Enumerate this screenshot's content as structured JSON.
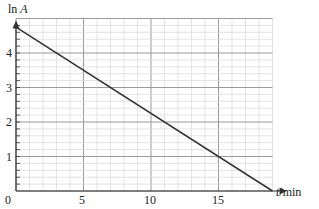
{
  "chart_data": {
    "type": "line",
    "title": "",
    "xlabel": "t/min",
    "ylabel": "ln A",
    "xlim": [
      0,
      20
    ],
    "ylim": [
      0,
      5
    ],
    "x_ticks": [
      "0",
      "5",
      "10",
      "15"
    ],
    "y_ticks": [
      "1",
      "2",
      "3",
      "4"
    ],
    "grid": true,
    "series": [
      {
        "name": "ln A",
        "x": [
          0,
          19
        ],
        "y": [
          4.75,
          0
        ]
      }
    ]
  },
  "labels": {
    "y_axis_main": "ln ",
    "y_axis_var": "A",
    "x_axis_var": "t",
    "x_axis_unit": "/min",
    "origin": "0",
    "x5": "5",
    "x10": "10",
    "x15": "15",
    "y1": "1",
    "y2": "2",
    "y3": "3",
    "y4": "4"
  },
  "colors": {
    "major_grid": "#9a9a9a",
    "minor_grid": "#d8d8d8",
    "line": "#333333",
    "axis": "#333333"
  }
}
